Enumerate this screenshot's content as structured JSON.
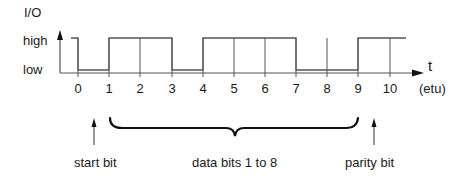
{
  "diagram": {
    "y_axis_label": "I/O",
    "level_high": "high",
    "level_low": "low",
    "x_axis_label": "t",
    "x_unit": "(etu)",
    "ticks": [
      "0",
      "1",
      "2",
      "3",
      "4",
      "5",
      "6",
      "7",
      "8",
      "9",
      "10"
    ],
    "signal_levels": [
      "high",
      "low",
      "high",
      "high",
      "low",
      "high",
      "high",
      "high",
      "low",
      "low",
      "high",
      "high"
    ],
    "annotations": {
      "start_bit": "start bit",
      "data_bits": "data bits 1 to 8",
      "parity_bit": "parity bit"
    },
    "line_color": "#555555"
  }
}
